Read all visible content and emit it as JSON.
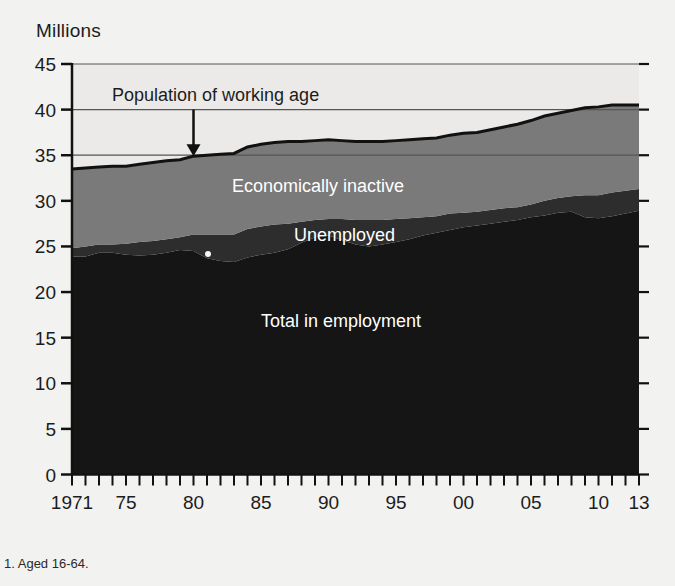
{
  "figure": {
    "unit_label": "Millions",
    "footnote": "1. Aged 16-64.",
    "callout": "Population of working age",
    "background_color": "#f2f2f0"
  },
  "colors": {
    "employment": "#151515",
    "unemployed": "#2d2d2d",
    "inactive": "#7a7a7a",
    "plot_background": "#eceae8",
    "axis": "#111111",
    "gridline": "#555555",
    "label_light": "#ffffff",
    "label_dark": "#1c1c1c"
  },
  "labels": {
    "inactive": "Economically inactive",
    "unemployed": "Unemployed",
    "employment": "Total in employment"
  },
  "chart_data": {
    "type": "area",
    "title": "",
    "subtitle": "",
    "xlabel": "",
    "ylabel": "Millions",
    "ylim": [
      0,
      45
    ],
    "ytick_values": [
      0,
      5,
      10,
      15,
      20,
      25,
      30,
      35,
      40,
      45
    ],
    "ytick_labels": [
      "0",
      "5",
      "10",
      "15",
      "20",
      "25",
      "30",
      "35",
      "40",
      "45"
    ],
    "gridlines_at": [
      35,
      40,
      45
    ],
    "grid": "partial",
    "legend": "inline-band-labels",
    "xlim": [
      1971,
      2013
    ],
    "x": [
      1971,
      1972,
      1973,
      1974,
      1975,
      1976,
      1977,
      1978,
      1979,
      1980,
      1981,
      1982,
      1983,
      1984,
      1985,
      1986,
      1987,
      1988,
      1989,
      1990,
      1991,
      1992,
      1993,
      1994,
      1995,
      1996,
      1997,
      1998,
      1999,
      2000,
      2001,
      2002,
      2003,
      2004,
      2005,
      2006,
      2007,
      2008,
      2009,
      2010,
      2011,
      2012,
      2013
    ],
    "xtick_labels": [
      "1971",
      "75",
      "80",
      "85",
      "90",
      "95",
      "00",
      "05",
      "10",
      "13"
    ],
    "xtick_label_years": [
      1971,
      1975,
      1980,
      1985,
      1990,
      1995,
      2000,
      2005,
      2010,
      2013
    ],
    "xtick_minor_every": 1,
    "stack_order": [
      "Total in employment",
      "Unemployed",
      "Economically inactive"
    ],
    "series": [
      {
        "name": "Total in employment",
        "values": [
          23.9,
          23.9,
          24.3,
          24.3,
          24.1,
          24.0,
          24.1,
          24.3,
          24.6,
          24.5,
          23.7,
          23.4,
          23.3,
          23.8,
          24.1,
          24.3,
          24.7,
          25.4,
          26.0,
          26.2,
          25.7,
          25.2,
          25.0,
          25.2,
          25.5,
          25.8,
          26.2,
          26.5,
          26.8,
          27.1,
          27.3,
          27.5,
          27.7,
          27.9,
          28.2,
          28.4,
          28.7,
          28.8,
          28.2,
          28.1,
          28.3,
          28.6,
          28.9
        ]
      },
      {
        "name": "Unemployed",
        "values": [
          0.9,
          1.1,
          0.9,
          0.9,
          1.2,
          1.5,
          1.5,
          1.5,
          1.4,
          1.8,
          2.6,
          2.9,
          3.0,
          3.1,
          3.1,
          3.1,
          2.8,
          2.3,
          1.9,
          1.8,
          2.3,
          2.7,
          2.9,
          2.7,
          2.5,
          2.3,
          2.0,
          1.8,
          1.8,
          1.6,
          1.5,
          1.5,
          1.5,
          1.4,
          1.4,
          1.6,
          1.6,
          1.7,
          2.4,
          2.5,
          2.6,
          2.5,
          2.4
        ]
      },
      {
        "name": "Economically inactive",
        "values": [
          8.7,
          8.6,
          8.5,
          8.6,
          8.5,
          8.5,
          8.6,
          8.6,
          8.5,
          8.6,
          8.7,
          8.8,
          8.9,
          9.0,
          9.0,
          9.0,
          9.0,
          8.8,
          8.7,
          8.7,
          8.6,
          8.6,
          8.6,
          8.6,
          8.6,
          8.6,
          8.6,
          8.6,
          8.6,
          8.7,
          8.7,
          8.8,
          8.9,
          9.1,
          9.2,
          9.3,
          9.3,
          9.4,
          9.6,
          9.7,
          9.6,
          9.4,
          9.2
        ]
      }
    ],
    "total_line": {
      "name": "Population of working age",
      "values": [
        33.5,
        33.6,
        33.7,
        33.8,
        33.8,
        34.0,
        34.2,
        34.4,
        34.5,
        34.9,
        35.0,
        35.1,
        35.2,
        35.9,
        36.2,
        36.4,
        36.5,
        36.5,
        36.6,
        36.7,
        36.6,
        36.5,
        36.5,
        36.5,
        36.6,
        36.7,
        36.8,
        36.9,
        37.2,
        37.4,
        37.5,
        37.8,
        38.1,
        38.4,
        38.8,
        39.3,
        39.6,
        39.9,
        40.2,
        40.3,
        40.5,
        40.5,
        40.5
      ]
    },
    "annotations": [
      {
        "text": "Population of working age",
        "arrow_from_year": 1980,
        "arrow_from_value": 40.0,
        "arrow_to_year": 1980,
        "arrow_to_value": 34.9
      }
    ]
  }
}
